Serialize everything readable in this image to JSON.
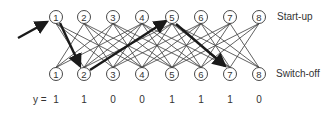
{
  "diagram": {
    "row_labels": {
      "top": "Start-up",
      "bottom": "Switch-off"
    },
    "nodes_top": [
      "1",
      "2",
      "3",
      "4",
      "5",
      "6",
      "7",
      "8"
    ],
    "nodes_bottom": [
      "1",
      "2",
      "3",
      "4",
      "5",
      "6",
      "7",
      "8"
    ],
    "y_label": "y =",
    "y_values": [
      "1",
      "1",
      "0",
      "0",
      "1",
      "1",
      "1",
      "0"
    ],
    "highlighted_path": [
      {
        "from": "top-1",
        "to": "bottom-2"
      },
      {
        "from": "bottom-2",
        "to": "top-5"
      },
      {
        "from": "top-5",
        "to": "bottom-7"
      }
    ],
    "entry_arrow_target": "top-1",
    "colors": {
      "line": "#3a3a3a",
      "highlight": "#1a1a1a",
      "node_fill": "#ffffff"
    }
  }
}
